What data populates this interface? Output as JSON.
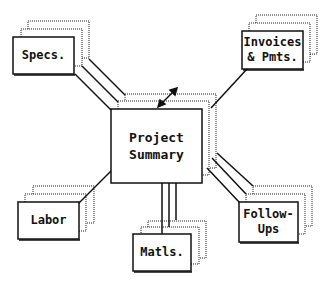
{
  "diagram": {
    "center": {
      "label_line1": "Project",
      "label_line2": "Summary"
    },
    "nodes": [
      {
        "id": "specs",
        "line1": "Specs.",
        "line2": ""
      },
      {
        "id": "invoices",
        "line1": "Invoices",
        "line2": "& Pmts."
      },
      {
        "id": "labor",
        "line1": "Labor",
        "line2": ""
      },
      {
        "id": "matls",
        "line1": "Matls.",
        "line2": ""
      },
      {
        "id": "followups",
        "line1": "Follow-",
        "line2": "Ups"
      }
    ],
    "resize_icon": "diagonal-double-arrow-icon",
    "colors": {
      "line": "#111111",
      "background": "#ffffff",
      "stack_dotted": "#333333"
    }
  }
}
